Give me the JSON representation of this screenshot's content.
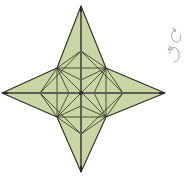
{
  "diagram": {
    "type": "origami-step",
    "fill_color": "#c9d6a3",
    "stroke_color": "#2b2e22",
    "highlight_color": "#ffffff",
    "symbol": "turn-over-icon",
    "symbol_color": "#bdbdbd"
  }
}
